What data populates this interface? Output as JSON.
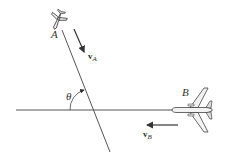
{
  "diagram": {
    "type": "relative-velocity",
    "planes": [
      {
        "id": "A",
        "label": "A",
        "velocity_label": "v",
        "velocity_subscript": "A",
        "heading": "down-right along inclined path"
      },
      {
        "id": "B",
        "label": "B",
        "velocity_label": "v",
        "velocity_subscript": "B",
        "heading": "left along horizontal path"
      }
    ],
    "angle_label": "θ",
    "colors": {
      "line": "#555555",
      "plane_fill": "#f2f2f2",
      "plane_stroke": "#444444",
      "text": "#333333"
    }
  }
}
